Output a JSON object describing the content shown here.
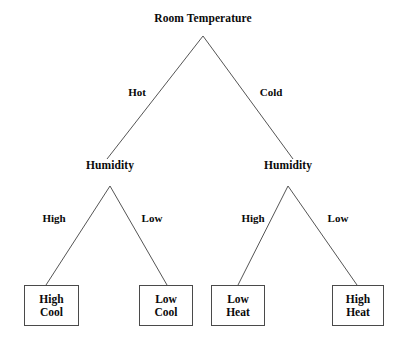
{
  "diagram": {
    "type": "decision-tree",
    "background_color": "#ffffff",
    "line_color": "#555555",
    "text_color": "#0a0a0a",
    "box_border_color": "#4a4a4a",
    "root": {
      "label": "Room Temperature",
      "x": 203,
      "y": 18
    },
    "decision_nodes": [
      {
        "label": "Humidity",
        "x": 110,
        "y": 165,
        "name": "humidity-node-left"
      },
      {
        "label": "Humidity",
        "x": 288,
        "y": 165,
        "name": "humidity-node-right"
      }
    ],
    "edge_labels": [
      {
        "label": "Hot",
        "x": 137,
        "y": 92,
        "name": "edge-label-hot"
      },
      {
        "label": "Cold",
        "x": 271,
        "y": 92,
        "name": "edge-label-cold"
      },
      {
        "label": "High",
        "x": 54,
        "y": 218,
        "name": "edge-label-high-left"
      },
      {
        "label": "Low",
        "x": 152,
        "y": 218,
        "name": "edge-label-low-left"
      },
      {
        "label": "High",
        "x": 253,
        "y": 218,
        "name": "edge-label-high-right"
      },
      {
        "label": "Low",
        "x": 338,
        "y": 218,
        "name": "edge-label-low-right"
      }
    ],
    "leaves": [
      {
        "line1": "High",
        "line2": "Cool",
        "x": 24,
        "y": 285,
        "w": 55,
        "h": 41,
        "name": "leaf-high-cool"
      },
      {
        "line1": "Low",
        "line2": "Cool",
        "x": 139,
        "y": 285,
        "w": 54,
        "h": 41,
        "name": "leaf-low-cool"
      },
      {
        "line1": "Low",
        "line2": "Heat",
        "x": 211,
        "y": 285,
        "w": 54,
        "h": 41,
        "name": "leaf-low-heat"
      },
      {
        "line1": "High",
        "line2": "Heat",
        "x": 332,
        "y": 285,
        "w": 52,
        "h": 41,
        "name": "leaf-high-heat"
      }
    ],
    "edges": [
      {
        "name": "edge-root-to-left-humidity",
        "x1": 203,
        "y1": 36,
        "x2": 107,
        "y2": 159
      },
      {
        "name": "edge-root-to-right-humidity",
        "x1": 203,
        "y1": 36,
        "x2": 293,
        "y2": 159
      },
      {
        "name": "edge-left-humidity-to-high-cool",
        "x1": 110,
        "y1": 186,
        "x2": 46,
        "y2": 285
      },
      {
        "name": "edge-left-humidity-to-low-cool",
        "x1": 110,
        "y1": 186,
        "x2": 167,
        "y2": 285
      },
      {
        "name": "edge-right-humidity-to-low-heat",
        "x1": 288,
        "y1": 186,
        "x2": 238,
        "y2": 285
      },
      {
        "name": "edge-right-humidity-to-high-heat",
        "x1": 288,
        "y1": 186,
        "x2": 357,
        "y2": 285
      }
    ]
  }
}
